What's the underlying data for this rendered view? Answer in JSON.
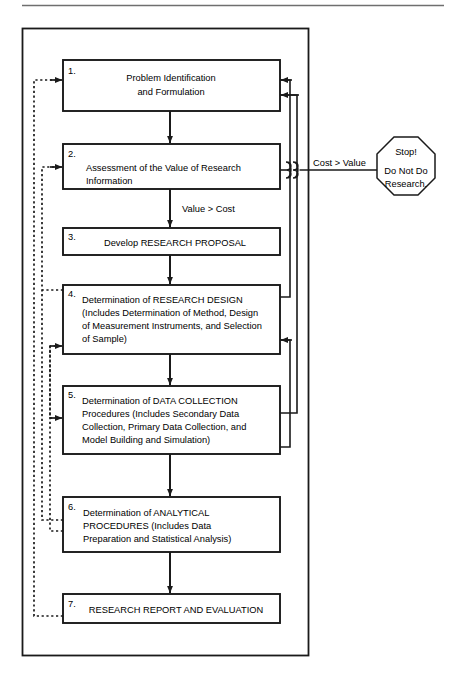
{
  "figure": {
    "type": "flowchart",
    "title_rule": true,
    "background": "#ffffff",
    "line_color": "#1a1a1a",
    "text_color": "#000000",
    "outer_frame": {
      "label": "research-process-frame"
    }
  },
  "steps": [
    {
      "number": "1.",
      "lines": [
        "Problem Identification",
        "and Formulation"
      ],
      "align": "center",
      "name": "step-1-problem-identification"
    },
    {
      "number": "2.",
      "lines": [
        "Assessment of the Value of Research",
        "Information"
      ],
      "align": "left",
      "name": "step-2-assessment-of-value"
    },
    {
      "number": "3.",
      "lines": [
        "Develop RESEARCH PROPOSAL"
      ],
      "align": "center",
      "name": "step-3-develop-research-proposal"
    },
    {
      "number": "4.",
      "lines": [
        "Determination of RESEARCH DESIGN",
        "(Includes Determination of Method, Design",
        "of Measurement Instruments, and Selection",
        "of Sample)"
      ],
      "align": "left",
      "name": "step-4-research-design"
    },
    {
      "number": "5.",
      "lines": [
        "Determination of DATA COLLECTION",
        "Procedures (Includes Secondary Data",
        "Collection, Primary Data Collection, and",
        "Model Building and Simulation)"
      ],
      "align": "left",
      "name": "step-5-data-collection"
    },
    {
      "number": "6.",
      "lines": [
        "Determination of ANALYTICAL",
        "PROCEDURES (Includes Data",
        "  Preparation and Statistical Analysis)"
      ],
      "align": "left",
      "name": "step-6-analytical-procedures"
    },
    {
      "number": "7.",
      "lines": [
        "RESEARCH REPORT AND EVALUATION"
      ],
      "align": "center",
      "name": "step-7-research-report"
    }
  ],
  "edge_labels": {
    "cost_greater_than_value": "Cost > Value",
    "value_greater_than_cost": "Value > Cost"
  },
  "terminator": {
    "shape": "octagon",
    "name": "stop-sign",
    "lines": [
      "Stop!",
      "Do Not Do",
      "Research."
    ]
  }
}
